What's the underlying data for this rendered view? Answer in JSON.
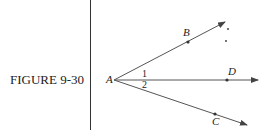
{
  "figure": {
    "caption": "FIGURE 9-30",
    "points": {
      "A": "A",
      "B": "B",
      "C": "C",
      "D": "D"
    },
    "angles": {
      "angle1": "1",
      "angle2": "2"
    }
  }
}
